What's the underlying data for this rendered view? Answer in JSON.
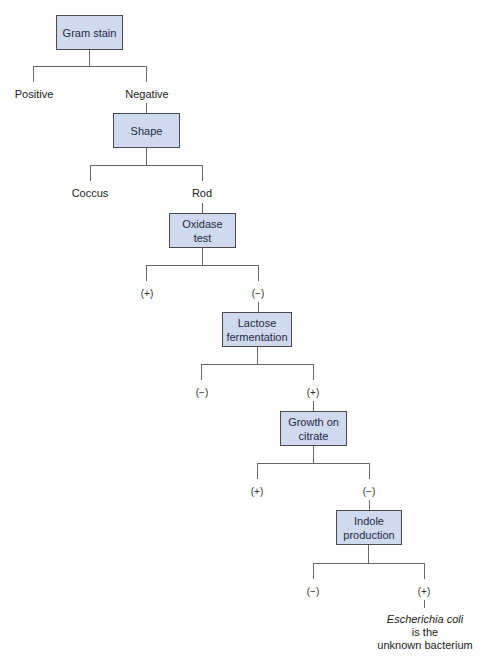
{
  "diagram": {
    "type": "decision-tree",
    "title_cropped": true,
    "colors": {
      "node_fill": "#cfd9ef",
      "node_border": "#4a4a4a",
      "line": "#666666"
    },
    "nodes": [
      {
        "id": "gram",
        "lines": [
          "Gram stain"
        ]
      },
      {
        "id": "shape",
        "lines": [
          "Shape"
        ]
      },
      {
        "id": "oxidase",
        "lines": [
          "Oxidase",
          "test"
        ]
      },
      {
        "id": "lactose",
        "lines": [
          "Lactose",
          "fermentation"
        ]
      },
      {
        "id": "citrate",
        "lines": [
          "Growth on",
          "citrate"
        ]
      },
      {
        "id": "indole",
        "lines": [
          "Indole",
          "production"
        ]
      }
    ],
    "branches": {
      "gram": {
        "left": "Positive",
        "right": "Negative"
      },
      "shape": {
        "left": "Coccus",
        "right": "Rod"
      },
      "oxidase": {
        "left": "(+)",
        "right": "(−)"
      },
      "lactose": {
        "left": "(−)",
        "right": "(+)"
      },
      "citrate": {
        "left": "(+)",
        "right": "(−)"
      },
      "indole": {
        "left": "(−)",
        "right": "(+)"
      }
    },
    "result": {
      "organism": "Escherichia coli",
      "line2": "is the",
      "line3": "unknown bacterium"
    }
  }
}
